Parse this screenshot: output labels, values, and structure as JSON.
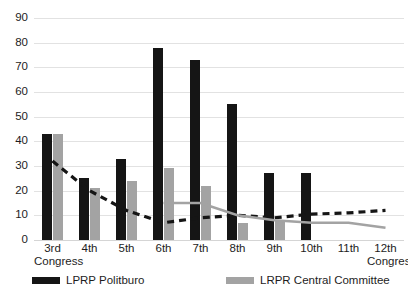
{
  "chart_data": {
    "type": "bar",
    "title": "",
    "xlabel": "Congress",
    "ylabel": "",
    "ylim": [
      0,
      90
    ],
    "ytick_step": 10,
    "grid": "horizontal",
    "legend_position": "bottom",
    "categories": [
      "3rd",
      "4th",
      "5th",
      "6th",
      "7th",
      "8th",
      "9th",
      "10th",
      "11th",
      "12th"
    ],
    "category_sublabels": [
      "Congress",
      "",
      "",
      "",
      "",
      "",
      "",
      "",
      "",
      "Congress"
    ],
    "yticks": [
      "0",
      "10",
      "20",
      "30",
      "40",
      "50",
      "60",
      "70",
      "80",
      "90"
    ],
    "series": [
      {
        "name": "LPRP Politburo",
        "kind": "bar",
        "color": "#151515",
        "values": [
          43,
          25,
          33,
          78,
          73,
          55,
          27,
          27,
          null,
          null
        ]
      },
      {
        "name": "LRPR Central Committee",
        "kind": "bar",
        "color": "#a3a3a3",
        "values": [
          43,
          21,
          24,
          29,
          22,
          7,
          8,
          null,
          null,
          null
        ]
      },
      {
        "name": "Politburo trend",
        "kind": "line-dashed",
        "color": "#151515",
        "values": [
          32,
          20,
          12,
          7,
          9,
          10,
          9,
          10.5,
          11,
          12
        ]
      },
      {
        "name": "Central Committee trend",
        "kind": "line-solid",
        "color": "#a3a3a3",
        "values": [
          null,
          null,
          null,
          15,
          15,
          10,
          8,
          7,
          7,
          5
        ]
      }
    ]
  },
  "legend": {
    "items": [
      {
        "label": "LPRP Politburo",
        "swatch": "black"
      },
      {
        "label": "LRPR Central Committee",
        "swatch": "gray"
      }
    ]
  },
  "colors": {
    "politburo": "#151515",
    "central_committee": "#a3a3a3",
    "gridline": "#e2e2e2",
    "background": "#ffffff"
  }
}
